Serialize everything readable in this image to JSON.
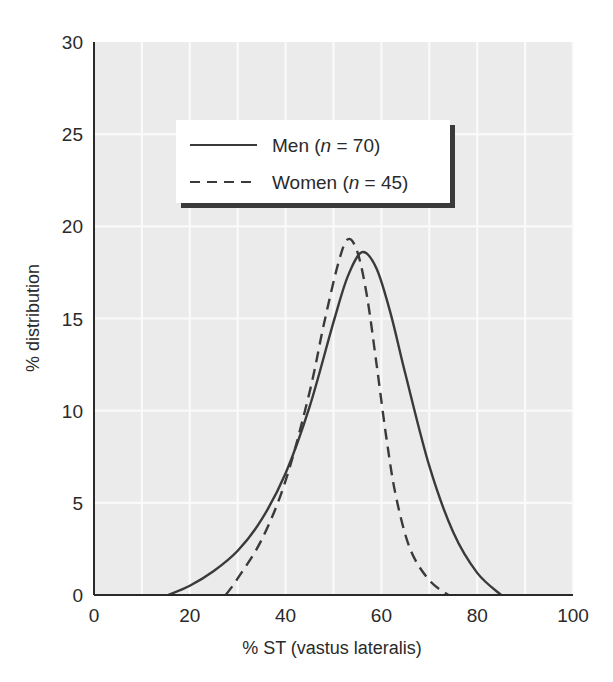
{
  "chart_data": {
    "type": "line",
    "title": "",
    "xlabel": "% ST (vastus lateralis)",
    "ylabel": "% distribution",
    "xlim": [
      0,
      100
    ],
    "ylim": [
      0,
      30
    ],
    "x_ticks": [
      0,
      20,
      40,
      60,
      80,
      100
    ],
    "y_ticks": [
      0,
      5,
      10,
      15,
      20,
      25,
      30
    ],
    "x_tick_labels": [
      "0",
      "20",
      "40",
      "60",
      "80",
      "100"
    ],
    "y_tick_labels": [
      "0",
      "5",
      "10",
      "15",
      "20",
      "25",
      "30"
    ],
    "grid": true,
    "grid_x_step": 10,
    "grid_y_step": 5,
    "legend_position": "upper-left inside plot",
    "series": [
      {
        "name": "Men (n = 70)",
        "label_prefix": "Men (",
        "label_n": "n",
        "label_suffix": " = 70)",
        "style": "solid",
        "x": [
          15.5,
          20,
          25,
          30,
          35,
          40,
          45,
          50,
          53,
          56,
          59,
          62,
          65,
          70,
          75,
          80,
          85
        ],
        "y": [
          0,
          0.5,
          1.3,
          2.4,
          4.1,
          6.6,
          10.2,
          14.8,
          17.3,
          18.6,
          17.7,
          15.2,
          12.0,
          7.0,
          3.4,
          1.2,
          0
        ]
      },
      {
        "name": "Women (n = 45)",
        "label_prefix": "Women (",
        "label_n": "n",
        "label_suffix": " = 45)",
        "style": "dashed",
        "x": [
          27.5,
          30,
          35,
          40,
          45,
          48,
          51,
          53,
          55,
          57,
          59,
          61,
          63,
          66,
          70,
          74
        ],
        "y": [
          0,
          0.9,
          3.0,
          6.2,
          11.0,
          14.7,
          18.0,
          19.3,
          18.6,
          16.2,
          12.5,
          8.6,
          5.4,
          2.5,
          0.8,
          0
        ]
      }
    ]
  },
  "colors": {
    "plot_background": "#ebebeb",
    "grid_lines": "#fafafa",
    "axis": "#2a2a2a",
    "curve": "#3a3a3a",
    "legend_background": "#ffffff",
    "legend_shadow": "#3a3a3a"
  }
}
